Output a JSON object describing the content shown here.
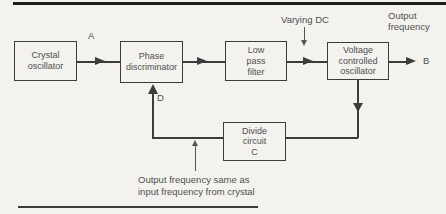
{
  "colors": {
    "line": "#3c3c3c",
    "text": "#4f4f4f",
    "rule": "#1d1d1d",
    "background": "#f3f2ee"
  },
  "diagram": {
    "boxes": {
      "crystal": {
        "lines": [
          "Crystal",
          "oscillator"
        ]
      },
      "phase": {
        "lines": [
          "Phase",
          "discriminator"
        ]
      },
      "lpf": {
        "lines": [
          "Low",
          "pass",
          "filter"
        ]
      },
      "vco": {
        "lines": [
          "Voltage",
          "controlled",
          "oscillator"
        ]
      },
      "divide": {
        "lines": [
          "Divide",
          "circuit",
          "C"
        ]
      }
    },
    "labels": {
      "a": "A",
      "b": "B",
      "d": "D",
      "varying_dc": "Varying DC",
      "output_frequency": [
        "Output",
        "frequency"
      ],
      "note": [
        "Output frequency same as",
        "input frequency from crystal"
      ]
    }
  }
}
